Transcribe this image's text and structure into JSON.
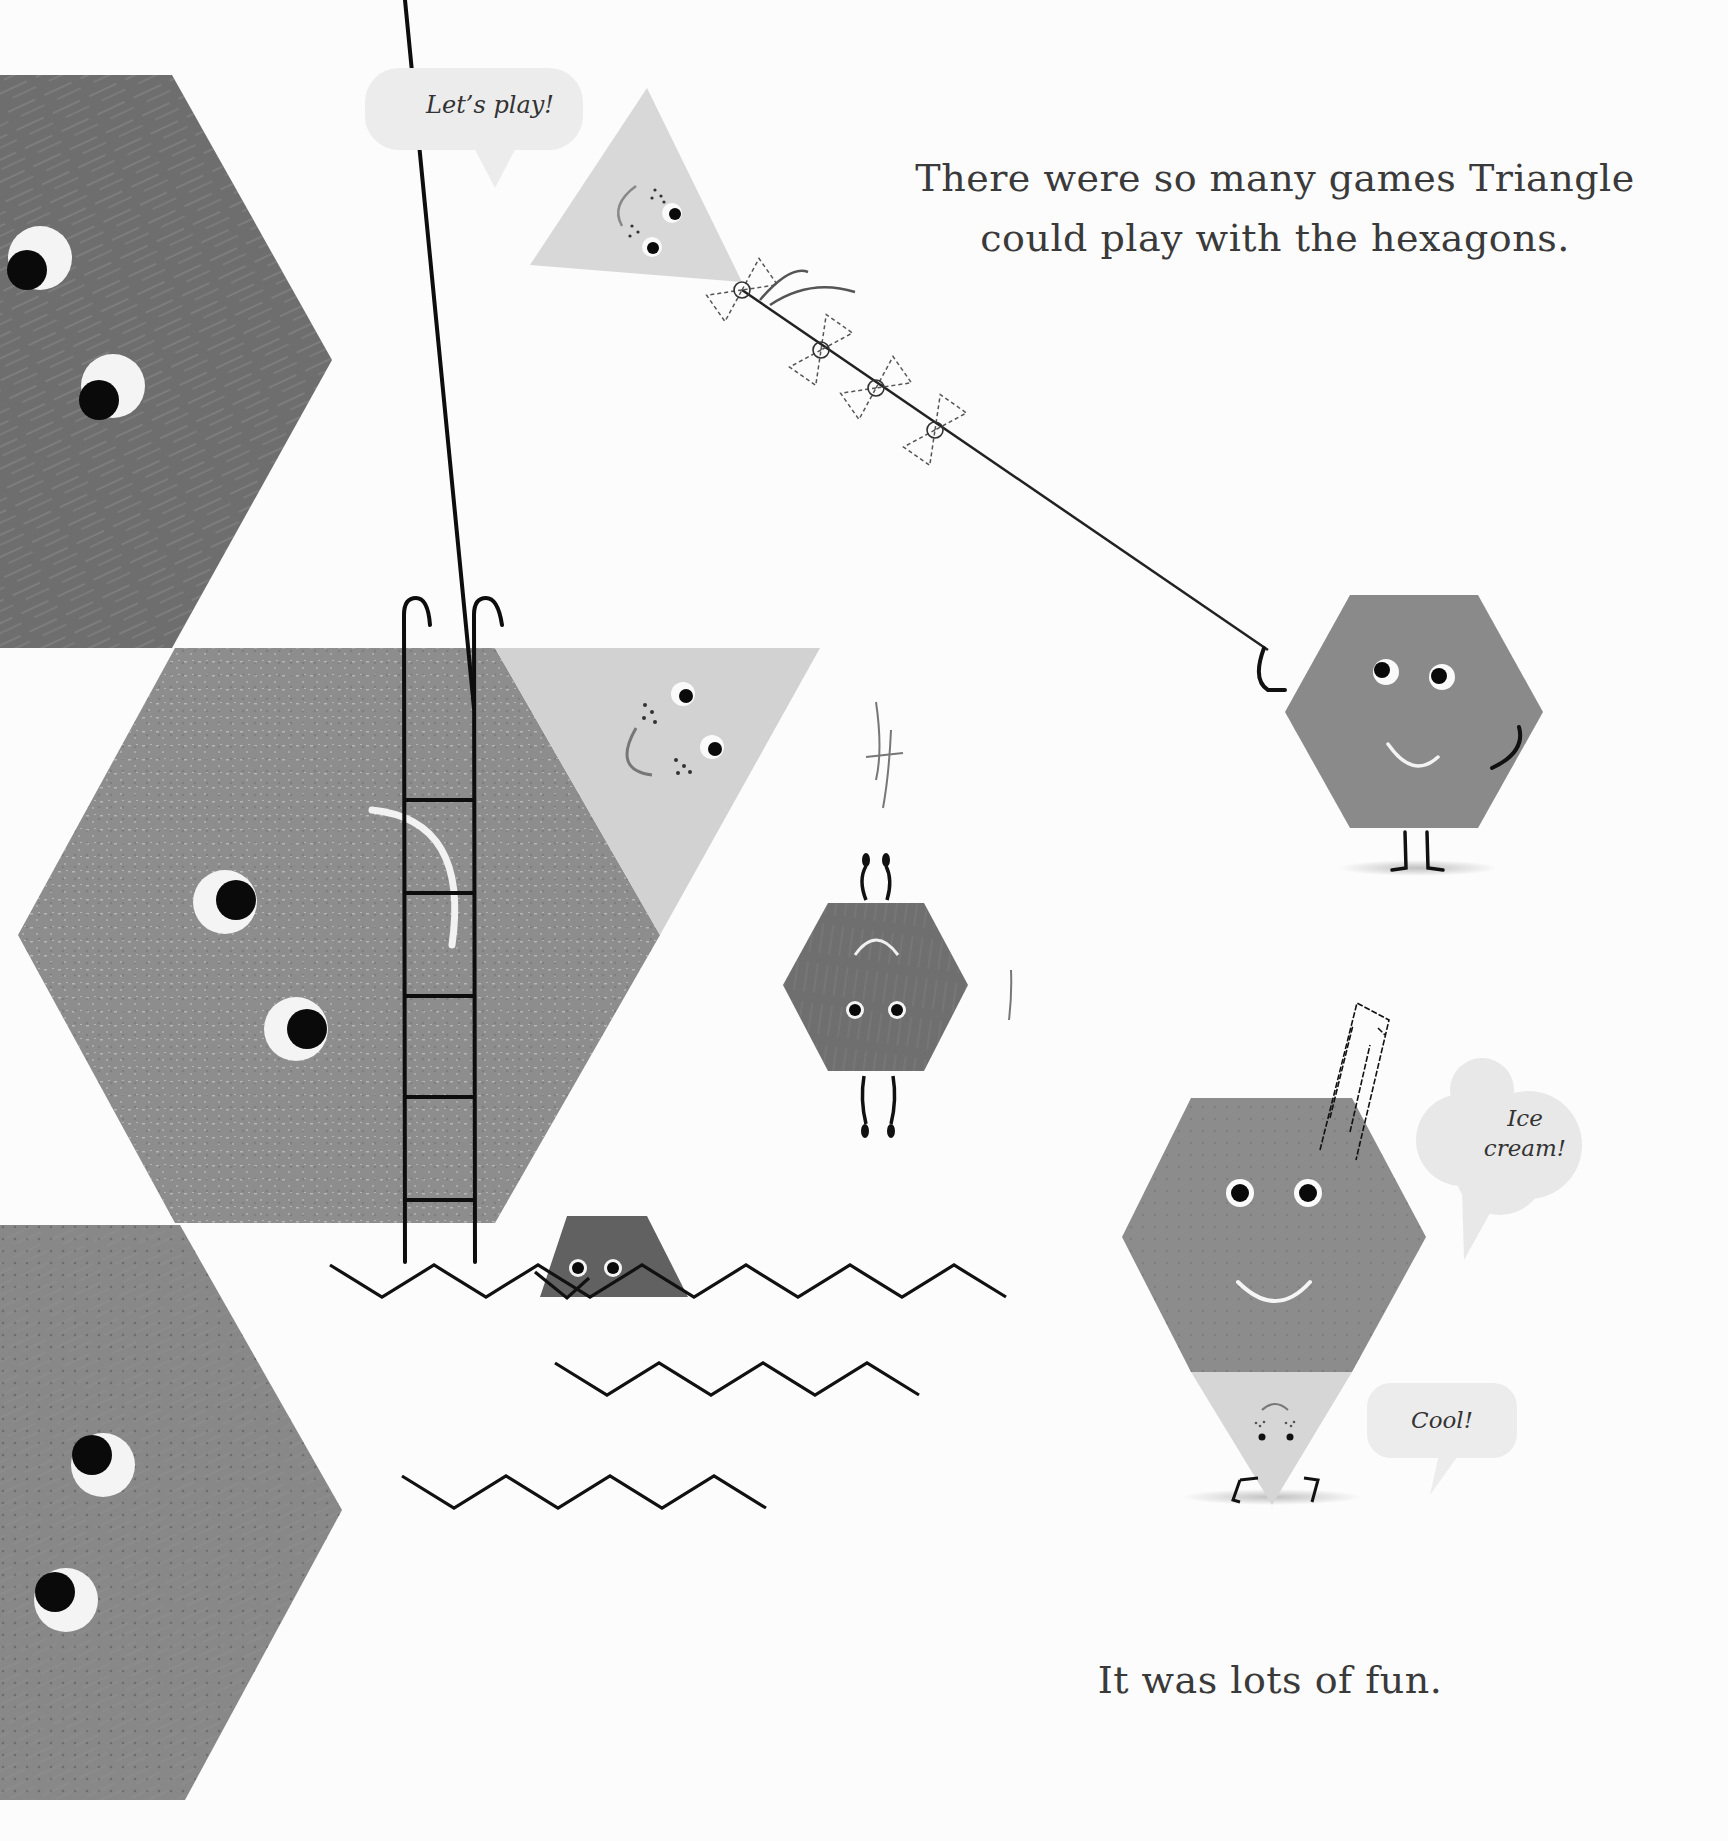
{
  "page": {
    "background_color": "#fcfcfc",
    "narration": {
      "top_line_1": "There were so many games Triangle",
      "top_line_2": "could play with the hexagons.",
      "bottom": "It was lots of fun."
    },
    "speech_bubbles": {
      "lets_play": "Let’s play!",
      "ice_cream_line_1": "Ice",
      "ice_cream_line_2": "cream!",
      "cool": "Cool!"
    },
    "colors": {
      "dark_gray_hexagon": "#6e6e6e",
      "mid_gray_hexagon": "#8f8f8f",
      "light_gray_triangle": "#d6d6d6",
      "bubble_fill": "#ececec",
      "ink": "#111111"
    },
    "scenes": [
      {
        "name": "kite",
        "description": "Triangle flying as a kite held by a hexagon"
      },
      {
        "name": "diving",
        "description": "Triangle on a ladder by large hexagons, hexagon diving into water"
      },
      {
        "name": "ice-cream",
        "description": "Hexagon stacked on Triangle forming an ice cream cone"
      }
    ]
  }
}
